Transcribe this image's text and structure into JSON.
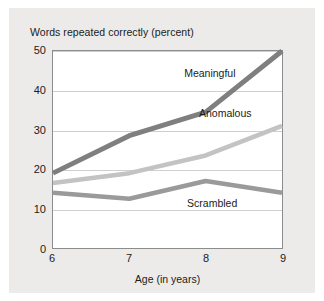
{
  "chart_data": {
    "type": "line",
    "title": "Words repeated correctly (percent)",
    "xlabel": "Age (in years)",
    "ylabel": "",
    "x": [
      6,
      7,
      8,
      9
    ],
    "xticklabels": [
      "6",
      "7",
      "8",
      "9"
    ],
    "yticklabels": [
      "0",
      "10",
      "20",
      "30",
      "40",
      "50"
    ],
    "yticks": [
      0,
      10,
      20,
      30,
      40,
      50
    ],
    "xlim": [
      6,
      9
    ],
    "ylim": [
      0,
      50
    ],
    "grid": "horizontal",
    "legend": "inline-annotations",
    "series": [
      {
        "name": "Meaningful",
        "values": [
          19,
          28.5,
          34.5,
          50
        ],
        "color": "#7f7f7f",
        "width": 5.0
      },
      {
        "name": "Anomalous",
        "values": [
          16.5,
          19,
          23.5,
          31
        ],
        "color": "#c3c3c3",
        "width": 4.6
      },
      {
        "name": "Scrambled",
        "values": [
          14,
          12.5,
          17,
          14
        ],
        "color": "#9a9a9a",
        "width": 4.6
      }
    ],
    "annotations": [
      {
        "text": "Meaningful",
        "x": 8.05,
        "y": 44.2
      },
      {
        "text": "Anomalous",
        "x": 8.25,
        "y": 34.1
      },
      {
        "text": "Scrambled",
        "x": 8.08,
        "y": 11.6
      }
    ]
  },
  "colors": {
    "page_background": "#ffffff",
    "panel_background": "#ecebe9",
    "plot_background": "#ffffff",
    "axis": "#8c8c8c",
    "gridline": "#cfcfcf",
    "text": "#1b1b1b"
  }
}
